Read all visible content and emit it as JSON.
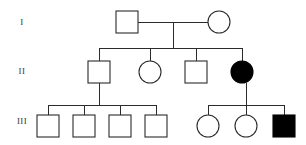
{
  "chart_data": {
    "type": "diagram",
    "diagram_kind": "pedigree",
    "colors": {
      "line": "#2b2b2b",
      "unaffected_fill": "#ffffff",
      "affected_fill": "#000000",
      "background": "#ffffff",
      "label_text": "#3a3a3a"
    },
    "legend": {
      "square": "male",
      "circle": "female",
      "filled": "affected",
      "open": "unaffected"
    },
    "generation_labels": [
      {
        "id": "gen-label-I",
        "text": "I",
        "x": 22,
        "y": 23
      },
      {
        "id": "gen-label-II",
        "text": "II",
        "x": 22,
        "y": 72
      },
      {
        "id": "gen-label-III",
        "text": "III",
        "x": 22,
        "y": 122
      }
    ],
    "individuals": [
      {
        "id": "I-1",
        "generation": "I",
        "sex": "male",
        "shape": "square",
        "affected": false,
        "cx": 127,
        "cy": 22,
        "size": 22
      },
      {
        "id": "I-2",
        "generation": "I",
        "sex": "female",
        "shape": "circle",
        "affected": false,
        "cx": 219,
        "cy": 22,
        "size": 22
      },
      {
        "id": "II-1",
        "generation": "II",
        "sex": "male",
        "shape": "square",
        "affected": false,
        "cx": 99,
        "cy": 72,
        "size": 22
      },
      {
        "id": "II-2",
        "generation": "II",
        "sex": "female",
        "shape": "circle",
        "affected": false,
        "cx": 150,
        "cy": 72,
        "size": 22
      },
      {
        "id": "II-3",
        "generation": "II",
        "sex": "male",
        "shape": "square",
        "affected": false,
        "cx": 196,
        "cy": 72,
        "size": 22
      },
      {
        "id": "II-4",
        "generation": "II",
        "sex": "female",
        "shape": "circle",
        "affected": true,
        "cx": 242,
        "cy": 72,
        "size": 22
      },
      {
        "id": "III-1",
        "generation": "III",
        "sex": "male",
        "shape": "square",
        "affected": false,
        "cx": 48,
        "cy": 126,
        "size": 22
      },
      {
        "id": "III-2",
        "generation": "III",
        "sex": "male",
        "shape": "square",
        "affected": false,
        "cx": 84,
        "cy": 126,
        "size": 22
      },
      {
        "id": "III-3",
        "generation": "III",
        "sex": "male",
        "shape": "square",
        "affected": false,
        "cx": 120,
        "cy": 126,
        "size": 22
      },
      {
        "id": "III-4",
        "generation": "III",
        "sex": "male",
        "shape": "square",
        "affected": false,
        "cx": 156,
        "cy": 126,
        "size": 22
      },
      {
        "id": "III-5",
        "generation": "III",
        "sex": "female",
        "shape": "circle",
        "affected": false,
        "cx": 208,
        "cy": 126,
        "size": 22
      },
      {
        "id": "III-6",
        "generation": "III",
        "sex": "female",
        "shape": "circle",
        "affected": false,
        "cx": 246,
        "cy": 126,
        "size": 22
      },
      {
        "id": "III-7",
        "generation": "III",
        "sex": "male",
        "shape": "square",
        "affected": true,
        "cx": 284,
        "cy": 126,
        "size": 22
      }
    ],
    "connections": [
      {
        "id": "mating-line-I",
        "kind": "mating",
        "x1": 138,
        "y1": 22,
        "x2": 208,
        "y2": 22
      },
      {
        "id": "descent-line-I",
        "kind": "descent",
        "x1": 173,
        "y1": 22,
        "x2": 173,
        "y2": 48
      },
      {
        "id": "sibship-line-II",
        "kind": "sibship",
        "x1": 99,
        "y1": 48,
        "x2": 242,
        "y2": 48
      },
      {
        "id": "drop-II-1",
        "kind": "drop",
        "x1": 99,
        "y1": 48,
        "x2": 99,
        "y2": 61
      },
      {
        "id": "drop-II-2",
        "kind": "drop",
        "x1": 150,
        "y1": 48,
        "x2": 150,
        "y2": 61
      },
      {
        "id": "drop-II-3",
        "kind": "drop",
        "x1": 196,
        "y1": 48,
        "x2": 196,
        "y2": 61
      },
      {
        "id": "drop-II-4",
        "kind": "drop",
        "x1": 242,
        "y1": 48,
        "x2": 242,
        "y2": 61
      },
      {
        "id": "descent-line-II-1",
        "kind": "descent",
        "x1": 99,
        "y1": 83,
        "x2": 99,
        "y2": 105
      },
      {
        "id": "sibship-line-III-left",
        "kind": "sibship",
        "x1": 48,
        "y1": 105,
        "x2": 156,
        "y2": 105
      },
      {
        "id": "drop-III-1",
        "kind": "drop",
        "x1": 48,
        "y1": 105,
        "x2": 48,
        "y2": 115
      },
      {
        "id": "drop-III-2",
        "kind": "drop",
        "x1": 84,
        "y1": 105,
        "x2": 84,
        "y2": 115
      },
      {
        "id": "drop-III-3",
        "kind": "drop",
        "x1": 120,
        "y1": 105,
        "x2": 120,
        "y2": 115
      },
      {
        "id": "drop-III-4",
        "kind": "drop",
        "x1": 156,
        "y1": 105,
        "x2": 156,
        "y2": 115
      },
      {
        "id": "descent-line-II-4",
        "kind": "descent",
        "x1": 246,
        "y1": 83,
        "x2": 246,
        "y2": 105
      },
      {
        "id": "sibship-line-III-right",
        "kind": "sibship",
        "x1": 208,
        "y1": 105,
        "x2": 284,
        "y2": 105
      },
      {
        "id": "drop-III-5",
        "kind": "drop",
        "x1": 208,
        "y1": 105,
        "x2": 208,
        "y2": 115
      },
      {
        "id": "drop-III-6",
        "kind": "drop",
        "x1": 246,
        "y1": 105,
        "x2": 246,
        "y2": 115
      },
      {
        "id": "drop-III-7",
        "kind": "drop",
        "x1": 284,
        "y1": 105,
        "x2": 284,
        "y2": 115
      }
    ]
  }
}
